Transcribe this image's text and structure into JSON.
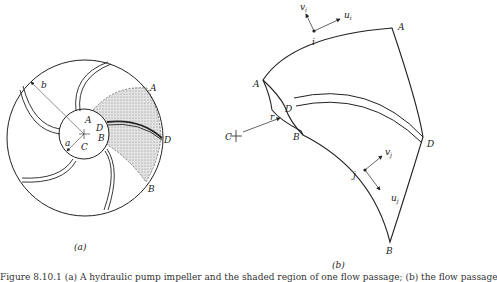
{
  "figure": {
    "panel_a": {
      "label": "(a)",
      "points": {
        "A": "A",
        "B": "B",
        "C": "C",
        "D": "D",
        "A_outer": "A",
        "B_outer": "B",
        "D_outer": "D"
      },
      "dimensions": {
        "inner_radius": "a",
        "outer_radius": "b"
      }
    },
    "panel_b": {
      "label": "(b)",
      "points": {
        "A_top": "A",
        "A_left": "A",
        "D_left": "D",
        "B_left": "B",
        "D_right": "D",
        "B_bottom": "B",
        "C": "C",
        "i": "i",
        "j": "j"
      },
      "vectors": {
        "r": "r",
        "vi": "v",
        "vi_sub": "i",
        "ui": "u",
        "ui_sub": "i",
        "vj": "v",
        "vj_sub": "j",
        "uj": "u",
        "uj_sub": "j"
      }
    },
    "caption": "Figure 8.10.1  (a) A hydraulic pump impeller and the shaded region of one flow passage; (b) the flow passage"
  }
}
